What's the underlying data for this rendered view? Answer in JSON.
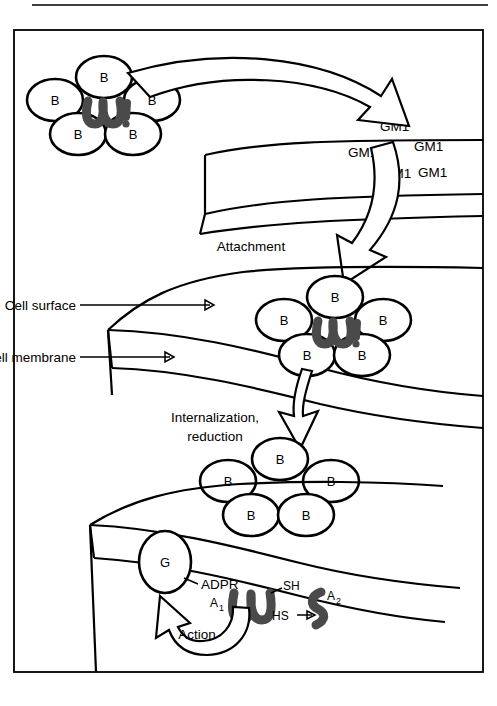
{
  "figure": {
    "background": "#ffffff",
    "ink": "#000000",
    "squiggle_color": "#4a4a4a",
    "frame": {
      "x": 14,
      "y": 30,
      "width": 469,
      "height": 642
    }
  },
  "labels": {
    "attachment": "Attachment",
    "cell_surface": "Cell surface",
    "cell_membrane": "Cell membrane",
    "internalization": "Internalization,",
    "reduction": "reduction",
    "action": "Action",
    "adpr": "ADPR",
    "sh_top": "SH",
    "hs_bottom": "HS",
    "g_protein": "G",
    "a1": "A",
    "a1_sub": "1",
    "a2": "A",
    "a2_sub": "2",
    "b_subunit": "B"
  },
  "receptors": {
    "name": "GM1",
    "count": 5,
    "positions": [
      {
        "x": 380,
        "y": 131
      },
      {
        "x": 414,
        "y": 151
      },
      {
        "x": 348,
        "y": 157
      },
      {
        "x": 382,
        "y": 178
      },
      {
        "x": 418,
        "y": 177
      }
    ]
  },
  "toxin_clusters": [
    {
      "id": "free-toxin",
      "has_a_subunit": true,
      "subunits": [
        {
          "label": "B",
          "cx": 104,
          "cy": 77,
          "rx": 28,
          "ry": 21
        },
        {
          "label": "B",
          "cx": 55,
          "cy": 100,
          "rx": 28,
          "ry": 21
        },
        {
          "label": "B",
          "cx": 152,
          "cy": 100,
          "rx": 28,
          "ry": 21
        },
        {
          "label": "B",
          "cx": 78,
          "cy": 134,
          "rx": 28,
          "ry": 21
        },
        {
          "label": "B",
          "cx": 133,
          "cy": 134,
          "rx": 28,
          "ry": 21
        }
      ]
    },
    {
      "id": "membrane-bound-toxin",
      "has_a_subunit": true,
      "subunits": [
        {
          "label": "B",
          "cx": 335,
          "cy": 297,
          "rx": 28,
          "ry": 21
        },
        {
          "label": "B",
          "cx": 284,
          "cy": 320,
          "rx": 28,
          "ry": 21
        },
        {
          "label": "B",
          "cx": 383,
          "cy": 320,
          "rx": 28,
          "ry": 21
        },
        {
          "label": "B",
          "cx": 307,
          "cy": 355,
          "rx": 28,
          "ry": 21
        },
        {
          "label": "B",
          "cx": 362,
          "cy": 355,
          "rx": 28,
          "ry": 21
        }
      ]
    },
    {
      "id": "dissociated-b-subunits",
      "has_a_subunit": false,
      "subunits": [
        {
          "label": "B",
          "cx": 280,
          "cy": 459,
          "rx": 28,
          "ry": 21
        },
        {
          "label": "B",
          "cx": 228,
          "cy": 481,
          "rx": 28,
          "ry": 21
        },
        {
          "label": "B",
          "cx": 331,
          "cy": 481,
          "rx": 28,
          "ry": 21
        },
        {
          "label": "B",
          "cx": 251,
          "cy": 515,
          "rx": 28,
          "ry": 21
        },
        {
          "label": "B",
          "cx": 306,
          "cy": 515,
          "rx": 28,
          "ry": 21
        }
      ]
    }
  ],
  "steps": [
    {
      "order": 1,
      "name": "Attachment",
      "text": "Attachment"
    },
    {
      "order": 2,
      "name": "Internalization",
      "text": "Internalization, reduction"
    },
    {
      "order": 3,
      "name": "Action",
      "text": "Action"
    }
  ]
}
